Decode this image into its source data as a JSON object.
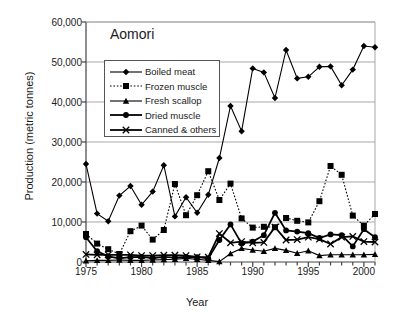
{
  "chart_data": {
    "type": "line",
    "title": "Aomori",
    "xlabel": "Year",
    "ylabel": "Production (metric tonnes)",
    "xlim": [
      1975,
      2001
    ],
    "ylim": [
      0,
      60000
    ],
    "ytick_labels": [
      "0",
      "10,000",
      "20,000",
      "30,000",
      "40,000",
      "50,000",
      "60,000"
    ],
    "ytick_values": [
      0,
      10000,
      20000,
      30000,
      40000,
      50000,
      60000
    ],
    "xtick_labels": [
      "1975",
      "1980",
      "1985",
      "1990",
      "1995",
      "2000"
    ],
    "xtick_values": [
      1975,
      1980,
      1985,
      1990,
      1995,
      2000
    ],
    "grid": "horizontal",
    "legend_position": "upper-left-inside",
    "x": [
      1975,
      1976,
      1977,
      1978,
      1979,
      1980,
      1981,
      1982,
      1983,
      1984,
      1985,
      1986,
      1987,
      1988,
      1989,
      1990,
      1991,
      1992,
      1993,
      1994,
      1995,
      1996,
      1997,
      1998,
      1999,
      2000,
      2001
    ],
    "series": [
      {
        "name": "Boiled meat",
        "marker": "diamond",
        "linestyle": "solid",
        "values": [
          24500,
          12100,
          10200,
          16600,
          19000,
          14300,
          17600,
          24200,
          11400,
          16200,
          12300,
          16800,
          26000,
          39000,
          32700,
          48400,
          47400,
          41000,
          53000,
          45900,
          46300,
          48800,
          48900,
          44200,
          48100,
          54000,
          53700
        ]
      },
      {
        "name": "Frozen muscle",
        "marker": "square",
        "linestyle": "dotted",
        "values": [
          7000,
          4600,
          3200,
          2000,
          7700,
          9100,
          5600,
          8000,
          19500,
          11700,
          16700,
          22700,
          15500,
          19600,
          10900,
          8600,
          8800,
          8700,
          11000,
          10300,
          9900,
          15200,
          24000,
          21800,
          11600,
          9100,
          12000
        ]
      },
      {
        "name": "Fresh scallop",
        "marker": "triangle",
        "linestyle": "solid",
        "values": [
          300,
          400,
          400,
          500,
          400,
          400,
          500,
          600,
          700,
          900,
          700,
          400,
          100,
          2100,
          3400,
          3000,
          2700,
          3400,
          2900,
          2200,
          2800,
          1600,
          1800,
          1800,
          1800,
          1800,
          1900
        ]
      },
      {
        "name": "Dried muscle",
        "marker": "circle",
        "linestyle": "solid",
        "values": [
          6200,
          2700,
          1400,
          900,
          1200,
          1300,
          1000,
          1300,
          1100,
          1300,
          1200,
          900,
          5500,
          9400,
          4600,
          5100,
          6700,
          12300,
          7900,
          7600,
          7200,
          6000,
          6900,
          6700,
          3900,
          8200,
          6200
        ]
      },
      {
        "name": "Canned & others",
        "marker": "cross",
        "linestyle": "solid",
        "values": [
          1900,
          1800,
          1800,
          1800,
          1800,
          1600,
          1600,
          1700,
          1700,
          1600,
          1300,
          1200,
          7100,
          4800,
          5100,
          4800,
          4900,
          8700,
          5500,
          5600,
          6200,
          5700,
          4500,
          6200,
          6400,
          5100,
          5000
        ]
      }
    ]
  }
}
